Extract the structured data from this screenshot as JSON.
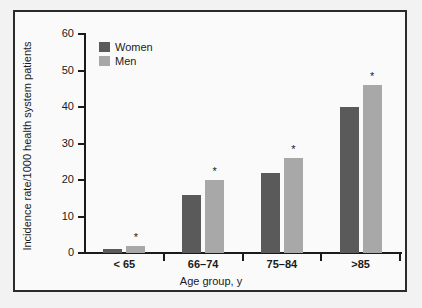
{
  "chart_data": {
    "type": "bar",
    "title": "",
    "xlabel": "Age group, y",
    "ylabel": "Incidence rate/1000 health system patients",
    "categories": [
      "< 65",
      "66–74",
      "75–84",
      ">85"
    ],
    "series": [
      {
        "name": "Women",
        "color": "#5a5a5a",
        "values": [
          1,
          16,
          22,
          40
        ]
      },
      {
        "name": "Men",
        "color": "#a8a8a8",
        "values": [
          2,
          20,
          26,
          46
        ]
      }
    ],
    "ylim": [
      0,
      60
    ],
    "yticks": [
      0,
      10,
      20,
      30,
      40,
      50,
      60
    ],
    "ytick_labels": [
      "0",
      "10",
      "20",
      "30",
      "40",
      "50",
      "60"
    ],
    "grid": false,
    "legend_position": "top-left",
    "annotations": [
      {
        "series": "Men",
        "category": "< 65",
        "symbol": "*"
      },
      {
        "series": "Men",
        "category": "66–74",
        "symbol": "*"
      },
      {
        "series": "Men",
        "category": "75–84",
        "symbol": "*"
      },
      {
        "series": "Men",
        "category": ">85",
        "symbol": "*"
      }
    ]
  },
  "legend": {
    "items": [
      {
        "label": "Women"
      },
      {
        "label": "Men"
      }
    ]
  },
  "colors": {
    "women": "#5a5a5a",
    "men": "#a8a8a8",
    "axis": "#1a1a1a",
    "frame": "#2b2b2b",
    "plot_background": "#fafafa",
    "figure_background": "#f2f2f2"
  }
}
